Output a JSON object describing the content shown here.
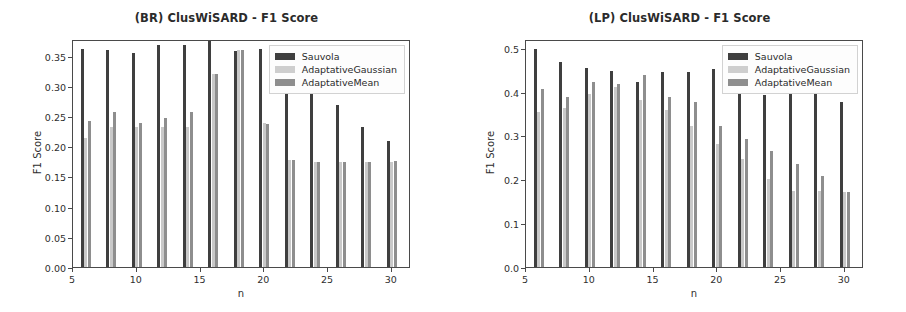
{
  "figure": {
    "panels": [
      "br",
      "lp"
    ]
  },
  "chart_data": [
    {
      "id": "br",
      "type": "bar",
      "title": "(BR) ClusWiSARD - F1 Score",
      "xlabel": "n",
      "ylabel": "F1 Score",
      "categories": [
        6,
        8,
        10,
        12,
        14,
        16,
        18,
        20,
        22,
        24,
        26,
        28,
        30
      ],
      "xlim": [
        5,
        31.5
      ],
      "ylim": [
        0.0,
        0.3775
      ],
      "xticks": [
        5,
        10,
        15,
        20,
        25,
        30
      ],
      "xticklabels": [
        "5",
        "10",
        "15",
        "20",
        "25",
        "30"
      ],
      "yticks": [
        0.0,
        0.05,
        0.1,
        0.15,
        0.2,
        0.25,
        0.3,
        0.35
      ],
      "yticklabels": [
        "0.00",
        "0.05",
        "0.10",
        "0.15",
        "0.20",
        "0.25",
        "0.30",
        "0.35"
      ],
      "grid": false,
      "legend_position": "upper right",
      "series": [
        {
          "name": "Sauvola",
          "color": "#3f3f3f",
          "values": [
            0.361,
            0.36,
            0.354,
            0.367,
            0.368,
            0.378,
            0.357,
            0.361,
            0.3,
            0.295,
            0.269,
            0.231,
            0.209
          ]
        },
        {
          "name": "AdaptativeGaussian",
          "color": "#c9c9c9",
          "values": [
            0.213,
            0.232,
            0.232,
            0.232,
            0.232,
            0.32,
            0.36,
            0.239,
            0.177,
            0.174,
            0.174,
            0.174,
            0.174
          ]
        },
        {
          "name": "AdaptativeMean",
          "color": "#8e8e8e",
          "values": [
            0.241,
            0.256,
            0.239,
            0.247,
            0.256,
            0.32,
            0.36,
            0.236,
            0.177,
            0.174,
            0.174,
            0.174,
            0.175
          ]
        }
      ]
    },
    {
      "id": "lp",
      "type": "bar",
      "title": "(LP) ClusWiSARD - F1 Score",
      "xlabel": "n",
      "ylabel": "F1 Score",
      "categories": [
        6,
        8,
        10,
        12,
        14,
        16,
        18,
        20,
        22,
        24,
        26,
        28,
        30
      ],
      "xlim": [
        5,
        31.5
      ],
      "ylim": [
        0.0,
        0.52
      ],
      "xticks": [
        5,
        10,
        15,
        20,
        25,
        30
      ],
      "xticklabels": [
        "5",
        "10",
        "15",
        "20",
        "25",
        "30"
      ],
      "yticks": [
        0.0,
        0.1,
        0.2,
        0.3,
        0.4,
        0.5
      ],
      "yticklabels": [
        "0.0",
        "0.1",
        "0.2",
        "0.3",
        "0.4",
        "0.5"
      ],
      "grid": false,
      "legend_position": "upper right",
      "series": [
        {
          "name": "Sauvola",
          "color": "#3f3f3f",
          "values": [
            0.497,
            0.468,
            0.453,
            0.447,
            0.421,
            0.445,
            0.445,
            0.452,
            0.394,
            0.393,
            0.394,
            0.395,
            0.376
          ]
        },
        {
          "name": "AdaptativeGaussian",
          "color": "#c9c9c9",
          "values": [
            0.353,
            0.363,
            0.394,
            0.41,
            0.382,
            0.357,
            0.321,
            0.281,
            0.247,
            0.201,
            0.174,
            0.173,
            0.172
          ]
        },
        {
          "name": "AdaptativeMean",
          "color": "#8e8e8e",
          "values": [
            0.406,
            0.387,
            0.421,
            0.417,
            0.437,
            0.388,
            0.376,
            0.322,
            0.291,
            0.265,
            0.234,
            0.207,
            0.172
          ]
        }
      ]
    }
  ]
}
